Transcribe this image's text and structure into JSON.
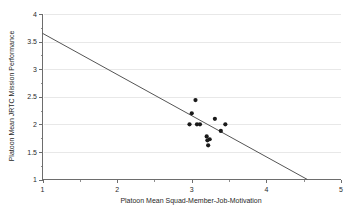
{
  "chart_data": {
    "type": "scatter",
    "title": "",
    "xlabel": "Platoon Mean Squad-Member-Job-Motivation",
    "ylabel": "Platoon Mean JRTC Mission Performance",
    "xlim": [
      1,
      5
    ],
    "ylim": [
      1,
      4
    ],
    "xticks": [
      1,
      2,
      3,
      4,
      5
    ],
    "xtick_labels": [
      "1",
      "2",
      "3",
      "4",
      "5"
    ],
    "xminor_ticks": [
      1.5,
      2.5,
      3.5,
      4.5
    ],
    "yticks": [
      1,
      1.5,
      2,
      2.5,
      3,
      3.5,
      4
    ],
    "ytick_labels": [
      "1",
      "1.5",
      "2",
      "2.5",
      "3",
      "3.5",
      "4"
    ],
    "grid": "horizontal-only",
    "legend": "none",
    "marker": "filled-circle",
    "marker_color": "#1a1a1a",
    "points": [
      {
        "x": 3.05,
        "y": 2.44
      },
      {
        "x": 3.0,
        "y": 2.2
      },
      {
        "x": 2.97,
        "y": 2.0
      },
      {
        "x": 3.07,
        "y": 2.0
      },
      {
        "x": 3.11,
        "y": 2.0
      },
      {
        "x": 3.31,
        "y": 2.1
      },
      {
        "x": 3.45,
        "y": 2.0
      },
      {
        "x": 3.39,
        "y": 1.88
      },
      {
        "x": 3.2,
        "y": 1.78
      },
      {
        "x": 3.24,
        "y": 1.73
      },
      {
        "x": 3.21,
        "y": 1.71
      },
      {
        "x": 3.22,
        "y": 1.62
      }
    ],
    "series": [
      {
        "name": "Platoons",
        "x": [
          3.05,
          3.0,
          2.97,
          3.07,
          3.11,
          3.31,
          3.45,
          3.39,
          3.2,
          3.24,
          3.21,
          3.22
        ],
        "values": [
          2.44,
          2.2,
          2.0,
          2.0,
          2.0,
          2.1,
          2.0,
          1.88,
          1.78,
          1.73,
          1.71,
          1.62
        ]
      }
    ],
    "trendline": {
      "type": "linear",
      "x_start": 1.0,
      "y_start": 3.65,
      "x_end": 4.55,
      "y_end": 1.0,
      "slope": -0.757,
      "intercept": 4.407,
      "color": "#555555"
    },
    "colors": {
      "axis": "#6d6d6d",
      "grid": "#e8e8e8",
      "text": "#1f1f1f",
      "marker": "#1a1a1a",
      "trendline": "#555555",
      "background": "#ffffff"
    }
  }
}
